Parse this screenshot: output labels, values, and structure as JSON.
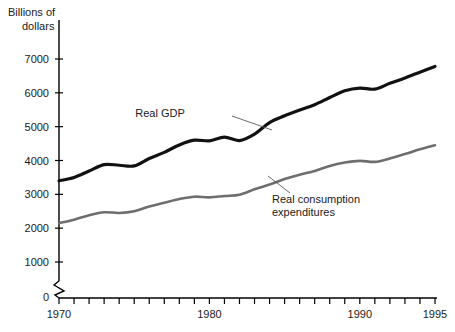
{
  "chart_data": {
    "type": "line",
    "title": "",
    "ylabel": "Billions of dollars",
    "xlabel": "",
    "xlim": [
      1970,
      1995
    ],
    "ylim": [
      0,
      7500
    ],
    "grid": false,
    "axis_break": true,
    "axis_break_note": "zigzag break on y-axis between 0 and 1000",
    "legend_position": "inline-annotations",
    "y_ticks": [
      "0",
      "1000",
      "2000",
      "3000",
      "4000",
      "5000",
      "6000",
      "7000"
    ],
    "y_tick_values": [
      0,
      1000,
      2000,
      3000,
      4000,
      5000,
      6000,
      7000
    ],
    "x_ticks": [
      "1970",
      "1980",
      "1990",
      "1995"
    ],
    "x_tick_values": [
      1970,
      1980,
      1990,
      1995
    ],
    "x_minor_tick_values": [
      1970,
      1971,
      1972,
      1973,
      1974,
      1975,
      1976,
      1977,
      1978,
      1979,
      1980,
      1981,
      1982,
      1983,
      1984,
      1985,
      1986,
      1987,
      1988,
      1989,
      1990,
      1991,
      1992,
      1993,
      1994,
      1995
    ],
    "x": [
      1970,
      1971,
      1972,
      1973,
      1974,
      1975,
      1976,
      1977,
      1978,
      1979,
      1980,
      1981,
      1982,
      1983,
      1984,
      1985,
      1986,
      1987,
      1988,
      1989,
      1990,
      1991,
      1992,
      1993,
      1994,
      1995
    ],
    "series": [
      {
        "name": "Real GDP",
        "color": "#111111",
        "width": 3.2,
        "values": [
          3400,
          3500,
          3690,
          3880,
          3860,
          3840,
          4060,
          4240,
          4460,
          4600,
          4580,
          4690,
          4590,
          4780,
          5120,
          5320,
          5490,
          5650,
          5860,
          6060,
          6140,
          6110,
          6280,
          6440,
          6610,
          6780
        ]
      },
      {
        "name": "Real consumption expenditures",
        "color": "#6e6e6e",
        "width": 2.6,
        "values": [
          2150,
          2250,
          2380,
          2470,
          2450,
          2500,
          2640,
          2750,
          2860,
          2930,
          2910,
          2950,
          2990,
          3150,
          3290,
          3450,
          3580,
          3690,
          3840,
          3940,
          3990,
          3960,
          4060,
          4190,
          4330,
          4450
        ]
      }
    ],
    "annotations": [
      {
        "name": "real-gdp-annotation",
        "text": "Real GDP",
        "label_x": 160,
        "label_y": 117,
        "leader_from_x": 232,
        "leader_from_y": 116,
        "leader_to_x": 272,
        "leader_to_y": 130
      },
      {
        "name": "real-consumption-annotation",
        "text_line_1": "Real consumption",
        "text_line_2": "expenditures",
        "label_x": 272,
        "label_y": 203,
        "label_y2": 216,
        "leader_from_x": 290,
        "leader_from_y": 193,
        "leader_to_x": 268,
        "leader_to_y": 176
      }
    ]
  },
  "axis": {
    "y_title_line_1": "Billions of",
    "y_title_line_2": "dollars"
  }
}
